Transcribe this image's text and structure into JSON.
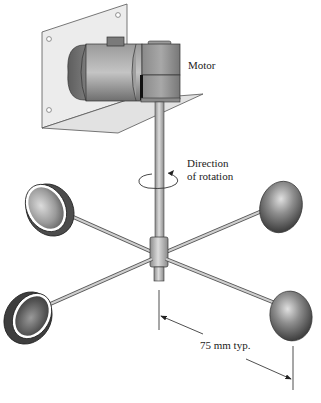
{
  "diagram": {
    "labels": {
      "motor": "Motor",
      "direction_line1": "Direction",
      "direction_line2": "of rotation",
      "dimension": "75 mm typ."
    },
    "components": [
      "mounting-plate",
      "motor",
      "gearbox",
      "shaft",
      "hub",
      "arms",
      "cups"
    ],
    "cup_count": 4,
    "colors": {
      "plate": "#e6e6e6",
      "motor_body": "#8c8c8c",
      "cup_dark": "#4a4a4a",
      "cup_light": "#d8d8d8",
      "line": "#333333"
    }
  }
}
